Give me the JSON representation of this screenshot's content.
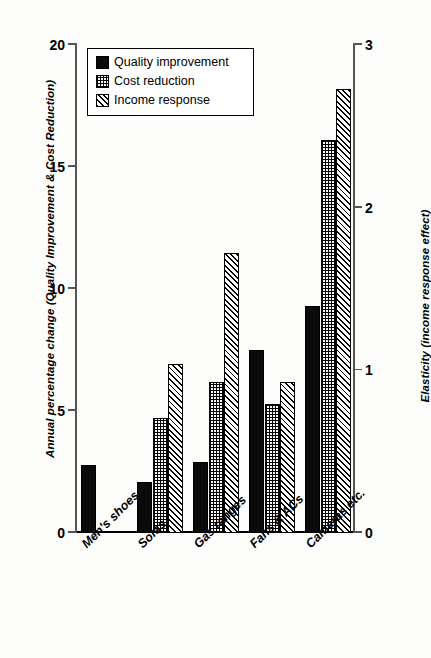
{
  "chart_data": {
    "type": "bar",
    "title": "",
    "categories": [
      "Men's shoes",
      "Sofas",
      "Gas ranges",
      "Fans & ACs",
      "Cameras etc."
    ],
    "series": [
      {
        "name": "Quality improvement",
        "axis": "left",
        "pattern": "solid",
        "values": [
          2.8,
          2.1,
          2.9,
          7.5,
          9.3
        ]
      },
      {
        "name": "Cost reduction",
        "axis": "left",
        "pattern": "grid",
        "values": [
          null,
          4.7,
          6.2,
          5.3,
          16.1
        ]
      },
      {
        "name": "Income response",
        "axis": "right",
        "pattern": "hatch",
        "values": [
          null,
          1.04,
          1.72,
          0.93,
          2.73
        ]
      }
    ],
    "ylabel": "Annual percentage change (Quality Improvement & Cost Reduction)",
    "ylabel_right": "Elasticity (income response effect)",
    "xlabel": "",
    "ylim": [
      0,
      20
    ],
    "ylim_right": [
      0,
      3
    ],
    "yticks": [
      "0",
      "5",
      "10",
      "15",
      "20"
    ],
    "yticks_right": [
      "0",
      "1",
      "2",
      "3"
    ],
    "grid": false,
    "legend_position": "top-left"
  },
  "legend": {
    "items": [
      {
        "label": "Quality improvement",
        "pattern": "solid"
      },
      {
        "label": "Cost reduction",
        "pattern": "grid"
      },
      {
        "label": "Income response",
        "pattern": "hatch"
      }
    ]
  },
  "axes": {
    "left_title": "Annual percentage change (Quality Improvement & Cost Reduction)",
    "right_title": "Elasticity (income response effect)",
    "left_ticks": [
      "0",
      "5",
      "10",
      "15",
      "20"
    ],
    "right_ticks": [
      "0",
      "1",
      "2",
      "3"
    ]
  },
  "colors": {
    "ink": "#000000",
    "axis": "#555555",
    "background": "#fdfdfb"
  }
}
